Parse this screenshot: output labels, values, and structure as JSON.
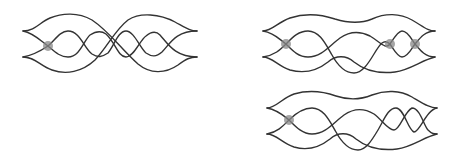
{
  "diagrams": [
    {
      "id": "left",
      "description": "Four-strand braid/lens diagram with one highlighted crossing",
      "markers": [
        {
          "x": 48,
          "y": 46
        }
      ]
    },
    {
      "id": "top-right",
      "description": "Four-strand braid/lens diagram with three highlighted crossings",
      "markers": [
        {
          "x": 286,
          "y": 44
        },
        {
          "x": 390,
          "y": 44
        },
        {
          "x": 415,
          "y": 44
        }
      ]
    },
    {
      "id": "bottom-right",
      "description": "Four-strand braid/lens diagram with one highlighted crossing",
      "markers": [
        {
          "x": 289,
          "y": 120
        }
      ]
    }
  ],
  "colors": {
    "stroke": "#333333",
    "marker": "#888888",
    "background": "#ffffff"
  }
}
